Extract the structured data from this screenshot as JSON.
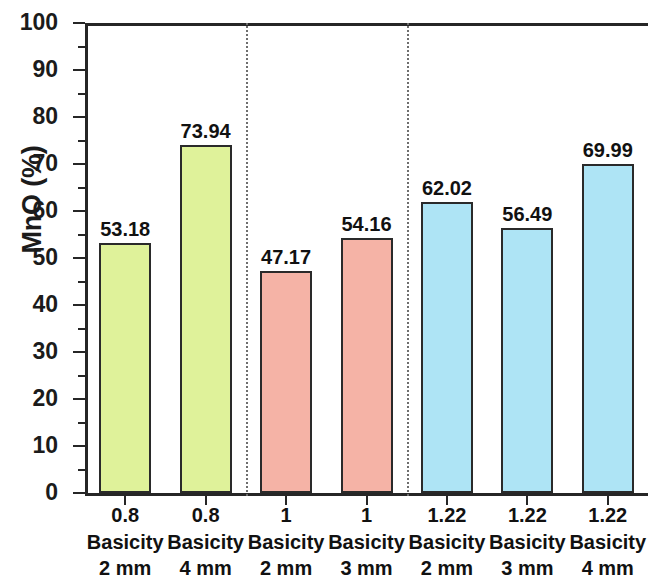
{
  "chart_data": {
    "type": "bar",
    "title": "",
    "subtitle": "",
    "xlabel": "",
    "ylabel": "MnO (%)",
    "ylim": [
      0,
      100
    ],
    "ytick_labels": [
      "0",
      "10",
      "20",
      "30",
      "40",
      "50",
      "60",
      "70",
      "80",
      "90",
      "100"
    ],
    "ytick_values": [
      0,
      10,
      20,
      30,
      40,
      50,
      60,
      70,
      80,
      90,
      100
    ],
    "yminor_tick_interval": 5,
    "grid": false,
    "legend": false,
    "categories": [
      "0.8 Basicity 2 mm",
      "0.8 Basicity 4 mm",
      "1 Basicity 2 mm",
      "1 Basicity 3 mm",
      "1.22 Basicity 2 mm",
      "1.22 Basicity 3 mm",
      "1.22 Basicity 4 mm"
    ],
    "values": [
      53.18,
      73.94,
      47.17,
      54.16,
      62.02,
      56.49,
      69.99
    ],
    "data_labels": [
      "53.18",
      "73.94",
      "47.17",
      "54.16",
      "62.02",
      "56.49",
      "69.99"
    ],
    "bars": [
      {
        "basicity": "0.8",
        "basicity_word": "Basicity",
        "size": "2 mm",
        "value": 53.18,
        "label": "53.18",
        "color": "#dff29a",
        "edge_color": "#2a2a2a",
        "group": "0.8"
      },
      {
        "basicity": "0.8",
        "basicity_word": "Basicity",
        "size": "4 mm",
        "value": 73.94,
        "label": "73.94",
        "color": "#dff29a",
        "edge_color": "#2a2a2a",
        "group": "0.8"
      },
      {
        "basicity": "1",
        "basicity_word": "Basicity",
        "size": "2 mm",
        "value": 47.17,
        "label": "47.17",
        "color": "#f5b3a6",
        "edge_color": "#2a2a2a",
        "group": "1"
      },
      {
        "basicity": "1",
        "basicity_word": "Basicity",
        "size": "3 mm",
        "value": 54.16,
        "label": "54.16",
        "color": "#f5b3a6",
        "edge_color": "#2a2a2a",
        "group": "1"
      },
      {
        "basicity": "1.22",
        "basicity_word": "Basicity",
        "size": "2 mm",
        "value": 62.02,
        "label": "62.02",
        "color": "#aee4f5",
        "edge_color": "#2a2a2a",
        "group": "1.22"
      },
      {
        "basicity": "1.22",
        "basicity_word": "Basicity",
        "size": "3 mm",
        "value": 56.49,
        "label": "56.49",
        "color": "#aee4f5",
        "edge_color": "#2a2a2a",
        "group": "1.22"
      },
      {
        "basicity": "1.22",
        "basicity_word": "Basicity",
        "size": "4 mm",
        "value": 69.99,
        "label": "69.99",
        "color": "#aee4f5",
        "edge_color": "#2a2a2a",
        "group": "1.22"
      }
    ],
    "group_separators": [
      2,
      4
    ],
    "colors": {
      "group_0_8": "#dff29a",
      "group_1": "#f5b3a6",
      "group_1_22": "#aee4f5",
      "axis": "#262626",
      "text": "#111111",
      "separator": "#6e6e6e",
      "background": "#ffffff"
    }
  }
}
